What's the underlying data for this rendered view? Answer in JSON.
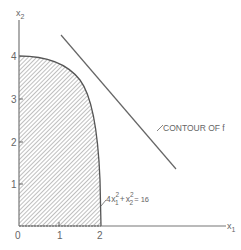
{
  "figure": {
    "axes": {
      "x_label": "x",
      "x_label_sub": "1",
      "y_label": "x",
      "y_label_sub": "2",
      "x_ticks": [
        "0",
        "1",
        "2"
      ],
      "y_ticks": [
        "1",
        "2",
        "3",
        "4"
      ]
    },
    "region": {
      "name": "feasible region",
      "fill": "hatched",
      "boundary_label": {
        "coef": "4",
        "var1": "x",
        "sub1": "1",
        "sup1": "2",
        "plus": "+",
        "var2": "x",
        "sub2": "2",
        "sup2": "2",
        "rhs": "= 16"
      }
    },
    "contour": {
      "label": "CONTOUR OF  f"
    },
    "colors": {
      "line": "#666666",
      "hatch": "#8a8a8a",
      "text": "#666666"
    }
  }
}
